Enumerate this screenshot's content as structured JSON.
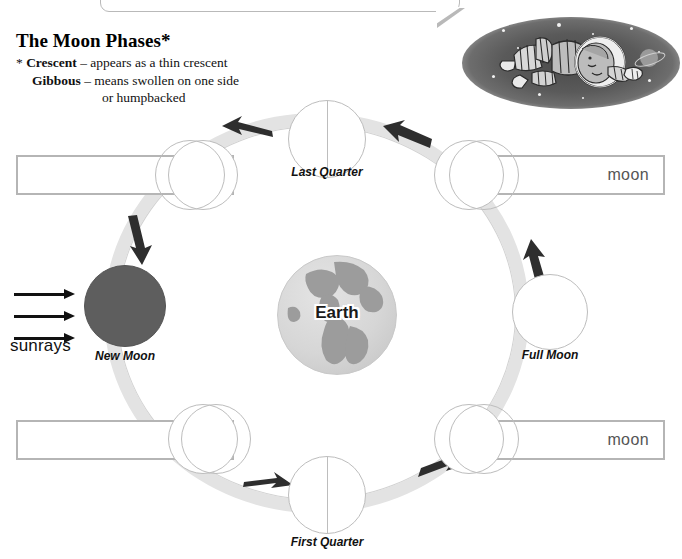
{
  "page": {
    "title": "The Moon Phases*",
    "width": 682,
    "height": 559
  },
  "definitions": [
    {
      "marker": "*",
      "term": "Crescent",
      "dash": "–",
      "text": "appears as a thin crescent"
    },
    {
      "marker": "",
      "term": "Gibbous",
      "dash": "–",
      "text": "means swollen on one side"
    },
    {
      "marker": "",
      "term": "",
      "dash": "",
      "text": "or humpbacked"
    }
  ],
  "center": {
    "label": "Earth"
  },
  "sunrays": {
    "label": "sunrays",
    "arrow_count": 3,
    "direction": "right"
  },
  "phases": [
    {
      "id": "new-moon",
      "label": "New Moon",
      "type": "new",
      "position": "left"
    },
    {
      "id": "waxing-crescent",
      "label": "",
      "type": "waxing-crescent",
      "position": "bottom-left"
    },
    {
      "id": "first-quarter",
      "label": "First Quarter",
      "type": "quarter",
      "position": "bottom"
    },
    {
      "id": "waxing-gibbous",
      "label": "",
      "type": "waxing-gibbous",
      "position": "bottom-right"
    },
    {
      "id": "full-moon",
      "label": "Full Moon",
      "type": "full",
      "position": "right"
    },
    {
      "id": "waning-gibbous",
      "label": "",
      "type": "waning-gibbous",
      "position": "top-right"
    },
    {
      "id": "last-quarter",
      "label": "Last Quarter",
      "type": "quarter",
      "position": "top"
    },
    {
      "id": "waning-crescent",
      "label": "",
      "type": "waning-crescent",
      "position": "top-left"
    }
  ],
  "answer_boxes": [
    {
      "id": "box-top-left",
      "value": "moon"
    },
    {
      "id": "box-top-right",
      "value": "moon"
    },
    {
      "id": "box-bottom-left",
      "value": "moon"
    },
    {
      "id": "box-bottom-right",
      "value": "moon"
    }
  ],
  "orbit": {
    "direction": "counterclockwise",
    "arrow_count": 6
  },
  "illustration": {
    "name": "astronaut-floating-in-space",
    "elements": [
      "astronaut",
      "stars",
      "ringed-planet"
    ]
  },
  "colors": {
    "orbit_band": "#e3e3e3",
    "moon_dark": "#5e5e5e",
    "earth_land": "#9c9c9c",
    "earth_ocean": "#d6d6d6",
    "box_border": "#b5b5b5",
    "space_oval": "#5a5a5a",
    "text": "#111111"
  }
}
